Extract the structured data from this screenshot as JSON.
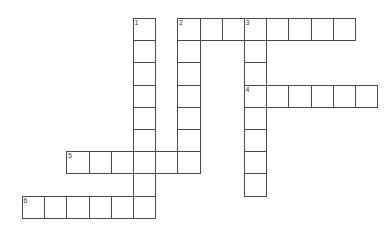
{
  "puzzle": {
    "title": "Crossword Grid",
    "background_color": "#ffffff",
    "cell_fill_color": "#ffffff",
    "cell_border_color": "#4a4a4a",
    "number_color": "#3a3a3a",
    "cell_size": 22.2,
    "origin_x": 22,
    "origin_y": 18,
    "columns": 16,
    "rows": 9,
    "entries": [
      {
        "number": "1",
        "direction": "down",
        "start_col": 5,
        "start_row": 0,
        "length": 9
      },
      {
        "number": "2",
        "direction": "across",
        "start_col": 7,
        "start_row": 0,
        "length": 8
      },
      {
        "number": "2",
        "direction": "down",
        "start_col": 7,
        "start_row": 0,
        "length": 7
      },
      {
        "number": "3",
        "direction": "down",
        "start_col": 10,
        "start_row": 0,
        "length": 8
      },
      {
        "number": "4",
        "direction": "across",
        "start_col": 10,
        "start_row": 3,
        "length": 6
      },
      {
        "number": "5",
        "direction": "across",
        "start_col": 2,
        "start_row": 6,
        "length": 6
      },
      {
        "number": "6",
        "direction": "across",
        "start_col": 0,
        "start_row": 8,
        "length": 6
      }
    ],
    "numbered_cells": [
      {
        "label": "1",
        "col": 5,
        "row": 0
      },
      {
        "label": "2",
        "col": 7,
        "row": 0
      },
      {
        "label": "3",
        "col": 10,
        "row": 0
      },
      {
        "label": "4",
        "col": 10,
        "row": 3
      },
      {
        "label": "5",
        "col": 2,
        "row": 6
      },
      {
        "label": "6",
        "col": 0,
        "row": 8
      }
    ]
  }
}
